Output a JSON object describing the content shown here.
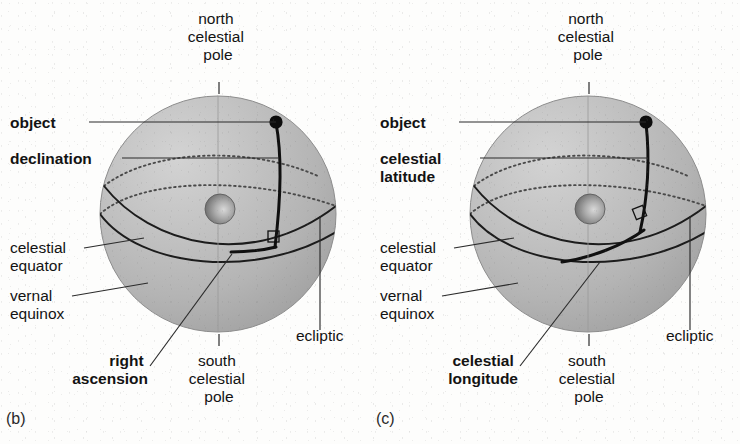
{
  "figure": {
    "caption_letters": [
      "(b)",
      "(c)"
    ],
    "background_color": "#fdfdfc",
    "ink_color": "#131313",
    "sphere_fill": "#b9b9b9"
  },
  "panels": [
    {
      "id": "b",
      "letter": "(b)",
      "coordinate_system": "equatorial",
      "labels": {
        "north_pole": "north\ncelestial\npole",
        "north_pole_lines": [
          "north",
          "celestial",
          "pole"
        ],
        "object": "object",
        "primary_angle": "declination",
        "primary_angle_lines": [
          "declination"
        ],
        "celestial_equator": "celestial\nequator",
        "celestial_equator_lines": [
          "celestial",
          "equator"
        ],
        "vernal_equinox": "vernal\nequinox",
        "vernal_equinox_lines": [
          "vernal",
          "equinox"
        ],
        "secondary_angle": "right\nascension",
        "secondary_angle_lines": [
          "right",
          "ascension"
        ],
        "south_pole": "south\ncelestial\npole",
        "south_pole_lines": [
          "south",
          "celestial",
          "pole"
        ],
        "ecliptic": "ecliptic"
      },
      "bold_labels": [
        "object",
        "declination",
        "right",
        "ascension"
      ],
      "regular_labels": [
        "north celestial pole",
        "celestial equator",
        "vernal equinox",
        "south celestial pole",
        "ecliptic"
      ]
    },
    {
      "id": "c",
      "letter": "(c)",
      "coordinate_system": "ecliptic",
      "labels": {
        "north_pole": "north\ncelestial\npole",
        "north_pole_lines": [
          "north",
          "celestial",
          "pole"
        ],
        "object": "object",
        "primary_angle": "celestial\nlatitude",
        "primary_angle_lines": [
          "celestial",
          "latitude"
        ],
        "celestial_equator": "celestial\nequator",
        "celestial_equator_lines": [
          "celestial",
          "equator"
        ],
        "vernal_equinox": "vernal\nequinox",
        "vernal_equinox_lines": [
          "vernal",
          "equinox"
        ],
        "secondary_angle": "celestial\nlongitude",
        "secondary_angle_lines": [
          "celestial",
          "longitude"
        ],
        "south_pole": "south\ncelestial\npole",
        "south_pole_lines": [
          "south",
          "celestial",
          "pole"
        ],
        "ecliptic": "ecliptic"
      },
      "bold_labels": [
        "object",
        "celestial",
        "latitude",
        "celestial",
        "longitude"
      ],
      "regular_labels": [
        "north celestial pole",
        "celestial equator",
        "vernal equinox",
        "south celestial pole",
        "ecliptic"
      ]
    }
  ]
}
